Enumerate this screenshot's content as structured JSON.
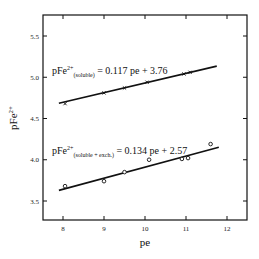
{
  "chart_data": {
    "type": "scatter",
    "title": "",
    "xlabel": "pe",
    "ylabel": "pFe2+",
    "ylabel_base": "pFe",
    "ylabel_sup": "2+",
    "xlim": [
      7.5,
      12.5
    ],
    "ylim": [
      3.25,
      5.75
    ],
    "xticks": [
      "8",
      "9",
      "10",
      "11",
      "12"
    ],
    "yticks": [
      "3.5",
      "4.0",
      "4.5",
      "5.0",
      "5.5"
    ],
    "grid": false,
    "legend": "none",
    "series": [
      {
        "name": "soluble",
        "marker": "x",
        "points": [
          [
            8.05,
            4.68
          ],
          [
            9.0,
            4.81
          ],
          [
            9.5,
            4.87
          ],
          [
            10.05,
            4.94
          ],
          [
            10.95,
            5.04
          ],
          [
            11.1,
            5.06
          ]
        ],
        "fit": {
          "slope": 0.117,
          "intercept": 3.76,
          "x_range": [
            7.9,
            11.75
          ]
        },
        "equation": {
          "lhs": "pFe",
          "sup": "2+",
          "sub": "(soluble)",
          "rhs": " = 0.117 pe + 3.76"
        }
      },
      {
        "name": "soluble + exch.",
        "marker": "o",
        "points": [
          [
            8.05,
            3.68
          ],
          [
            9.0,
            3.74
          ],
          [
            9.5,
            3.85
          ],
          [
            10.1,
            4.0
          ],
          [
            10.9,
            4.01
          ],
          [
            11.05,
            4.02
          ],
          [
            11.6,
            4.19
          ]
        ],
        "fit": {
          "slope": 0.134,
          "intercept": 2.57,
          "x_range": [
            7.9,
            11.8
          ]
        },
        "equation": {
          "lhs": "pFe",
          "sup": "2+",
          "sub": "(soluble + exch.)",
          "rhs": " = 0.134 pe + 2.57"
        }
      }
    ]
  }
}
